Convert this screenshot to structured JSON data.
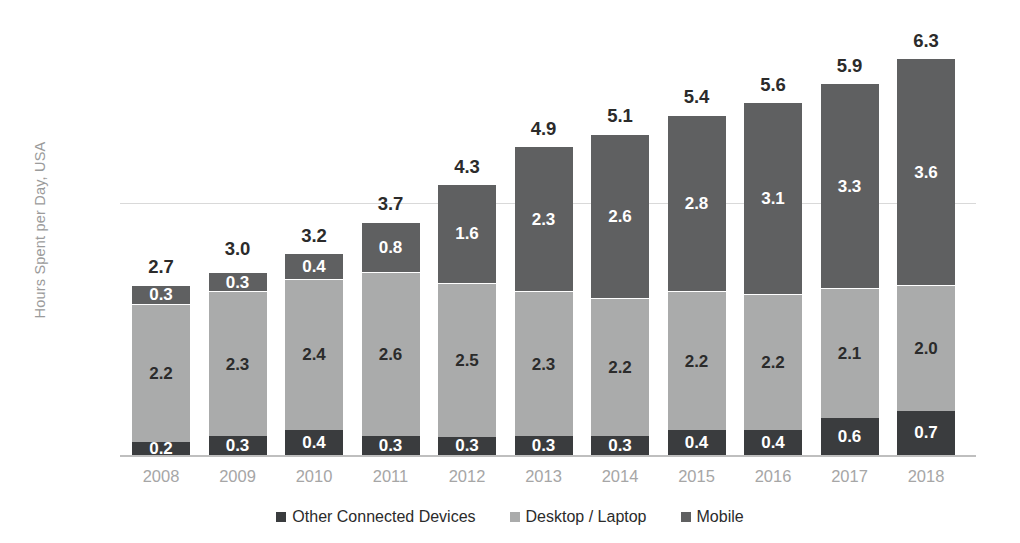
{
  "chart_data": {
    "type": "bar",
    "stacked": true,
    "title": "",
    "subtitle": "",
    "xlabel": "",
    "ylabel": "Hours Spent per Day, USA",
    "ylim": [
      0,
      6.8
    ],
    "yticks": [
      "0",
      "4"
    ],
    "ytick_values": [
      0,
      4
    ],
    "grid": true,
    "legend_position": "bottom",
    "categories": [
      "2008",
      "2009",
      "2010",
      "2011",
      "2012",
      "2013",
      "2014",
      "2015",
      "2016",
      "2017",
      "2018"
    ],
    "series": [
      {
        "name": "Other Connected Devices",
        "color": "#3a3c3e",
        "values": [
          0.2,
          0.3,
          0.4,
          0.3,
          0.3,
          0.3,
          0.3,
          0.4,
          0.4,
          0.6,
          0.7
        ],
        "labels": [
          "0.2",
          "0.3",
          "0.4",
          "0.3",
          "0.3",
          "0.3",
          "0.3",
          "0.4",
          "0.4",
          "0.6",
          "0.7"
        ]
      },
      {
        "name": "Desktop / Laptop",
        "color": "#aaabab",
        "values": [
          2.2,
          2.3,
          2.4,
          2.6,
          2.5,
          2.3,
          2.2,
          2.2,
          2.2,
          2.1,
          2.0
        ],
        "labels": [
          "2.2",
          "2.3",
          "2.4",
          "2.6",
          "2.5",
          "2.3",
          "2.2",
          "2.2",
          "2.2",
          "2.1",
          "2.0"
        ]
      },
      {
        "name": "Mobile",
        "color": "#5f6061",
        "values": [
          0.3,
          0.3,
          0.4,
          0.8,
          1.6,
          2.3,
          2.6,
          2.8,
          3.1,
          3.3,
          3.6
        ],
        "labels": [
          "0.3",
          "0.3",
          "0.4",
          "0.8",
          "1.6",
          "2.3",
          "2.6",
          "2.8",
          "3.1",
          "3.3",
          "3.6"
        ]
      }
    ],
    "totals": [
      2.7,
      3.0,
      3.2,
      3.7,
      4.3,
      4.9,
      5.1,
      5.4,
      5.6,
      5.9,
      6.3
    ],
    "total_labels": [
      "2.7",
      "3.0",
      "3.2",
      "3.7",
      "4.3",
      "4.9",
      "5.1",
      "5.4",
      "5.6",
      "5.9",
      "6.3"
    ]
  },
  "legend": {
    "items": [
      {
        "label": "Other Connected Devices",
        "color": "#3a3c3e",
        "marker": "square-marker"
      },
      {
        "label": "Desktop / Laptop",
        "color": "#aaabab",
        "marker": "square-marker"
      },
      {
        "label": "Mobile",
        "color": "#5f6061",
        "marker": "square-marker"
      }
    ]
  },
  "axes": {
    "y_title": "Hours Spent per Day, USA",
    "y_tick_top": "4",
    "y_tick_bottom": "0"
  }
}
